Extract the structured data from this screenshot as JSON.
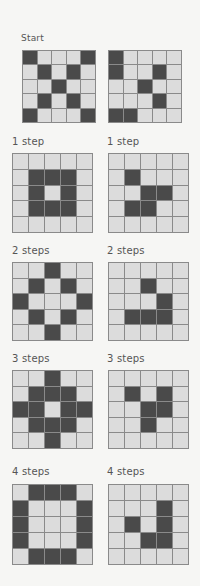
{
  "colors": {
    "background": "#f6f6f4",
    "cell_off": "#dcdcdc",
    "cell_on": "#4a4a4a",
    "grid_line": "#8a8a8a",
    "label": "#555555"
  },
  "stages": [
    {
      "label_left": "Start",
      "label_right": "",
      "left": [
        [
          1,
          0,
          0,
          0,
          1
        ],
        [
          0,
          1,
          0,
          1,
          0
        ],
        [
          0,
          0,
          1,
          0,
          0
        ],
        [
          0,
          1,
          0,
          1,
          0
        ],
        [
          1,
          0,
          0,
          0,
          1
        ]
      ],
      "right": [
        [
          1,
          0,
          0,
          0,
          0
        ],
        [
          1,
          0,
          0,
          1,
          0
        ],
        [
          0,
          0,
          1,
          0,
          0
        ],
        [
          0,
          0,
          0,
          1,
          0
        ],
        [
          1,
          1,
          0,
          0,
          0
        ]
      ]
    },
    {
      "label_left": "1 step",
      "label_right": "1 step",
      "left": [
        [
          0,
          0,
          0,
          0,
          0
        ],
        [
          0,
          1,
          1,
          1,
          0
        ],
        [
          0,
          1,
          0,
          1,
          0
        ],
        [
          0,
          1,
          1,
          1,
          0
        ],
        [
          0,
          0,
          0,
          0,
          0
        ]
      ],
      "right": [
        [
          0,
          0,
          0,
          0,
          0
        ],
        [
          0,
          1,
          0,
          0,
          0
        ],
        [
          0,
          0,
          1,
          1,
          0
        ],
        [
          0,
          1,
          1,
          0,
          0
        ],
        [
          0,
          0,
          0,
          0,
          0
        ]
      ]
    },
    {
      "label_left": "2 steps",
      "label_right": "2 steps",
      "left": [
        [
          0,
          0,
          1,
          0,
          0
        ],
        [
          0,
          1,
          0,
          1,
          0
        ],
        [
          1,
          0,
          0,
          0,
          1
        ],
        [
          0,
          1,
          0,
          1,
          0
        ],
        [
          0,
          0,
          1,
          0,
          0
        ]
      ],
      "right": [
        [
          0,
          0,
          0,
          0,
          0
        ],
        [
          0,
          0,
          1,
          0,
          0
        ],
        [
          0,
          0,
          0,
          1,
          0
        ],
        [
          0,
          1,
          1,
          1,
          0
        ],
        [
          0,
          0,
          0,
          0,
          0
        ]
      ]
    },
    {
      "label_left": "3 steps",
      "label_right": "3 steps",
      "left": [
        [
          0,
          0,
          1,
          0,
          0
        ],
        [
          0,
          1,
          1,
          1,
          0
        ],
        [
          1,
          1,
          0,
          1,
          1
        ],
        [
          0,
          1,
          1,
          1,
          0
        ],
        [
          0,
          0,
          1,
          0,
          0
        ]
      ],
      "right": [
        [
          0,
          0,
          0,
          0,
          0
        ],
        [
          0,
          1,
          0,
          1,
          0
        ],
        [
          0,
          0,
          1,
          1,
          0
        ],
        [
          0,
          0,
          1,
          0,
          0
        ],
        [
          0,
          0,
          0,
          0,
          0
        ]
      ]
    },
    {
      "label_left": "4 steps",
      "label_right": "4 steps",
      "left": [
        [
          0,
          1,
          1,
          1,
          0
        ],
        [
          1,
          0,
          0,
          0,
          1
        ],
        [
          1,
          0,
          0,
          0,
          1
        ],
        [
          1,
          0,
          0,
          0,
          1
        ],
        [
          0,
          1,
          1,
          1,
          0
        ]
      ],
      "right": [
        [
          0,
          0,
          0,
          0,
          0
        ],
        [
          0,
          0,
          0,
          1,
          0
        ],
        [
          0,
          1,
          0,
          1,
          0
        ],
        [
          0,
          0,
          1,
          1,
          0
        ],
        [
          0,
          0,
          0,
          0,
          0
        ]
      ]
    }
  ]
}
